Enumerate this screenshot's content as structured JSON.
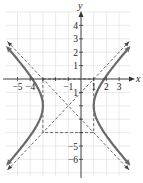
{
  "chart_data": {
    "type": "line",
    "title": "",
    "xlabel": "x",
    "ylabel": "y",
    "xlim": [
      -6,
      4
    ],
    "ylim": [
      -7,
      5
    ],
    "grid": true,
    "x_ticks": [
      -5,
      -4,
      -3,
      -2,
      -1,
      1,
      2,
      3
    ],
    "x_tick_labels": [
      {
        "value": -5,
        "text": "−5"
      },
      {
        "value": -4,
        "text": "−4"
      },
      {
        "value": -1,
        "text": "−1"
      },
      {
        "value": 1,
        "text": "1"
      },
      {
        "value": 2,
        "text": "2"
      },
      {
        "value": 3,
        "text": "3"
      }
    ],
    "y_ticks": [
      4,
      3,
      2,
      1,
      -1,
      -2,
      -3,
      -4,
      -5,
      -6
    ],
    "y_tick_labels": [
      {
        "value": 4,
        "text": "4"
      },
      {
        "value": 3,
        "text": "3"
      },
      {
        "value": 2,
        "text": "2"
      },
      {
        "value": 1,
        "text": "1"
      },
      {
        "value": -1,
        "text": "1"
      },
      {
        "value": -5,
        "text": "−5"
      },
      {
        "value": -6,
        "text": "−6"
      }
    ],
    "hyperbola": {
      "equation": "(x+1)^2/4 - (y+2)^2/4 = 1",
      "center": [
        -1,
        -2
      ],
      "a": 2,
      "b": 2,
      "orientation": "horizontal",
      "vertices": [
        [
          -3,
          -2
        ],
        [
          1,
          -2
        ]
      ]
    },
    "asymptotes": [
      {
        "equation": "y = x - 1",
        "style": "dashed"
      },
      {
        "equation": "y = -x - 3",
        "style": "dashed"
      }
    ],
    "fundamental_rectangle": {
      "x": [
        -3,
        1
      ],
      "y": [
        -4,
        0
      ],
      "style": "dashed"
    }
  }
}
